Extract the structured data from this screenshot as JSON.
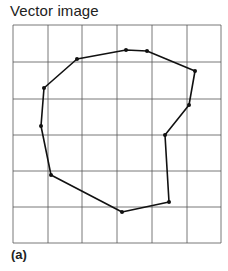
{
  "title": "Vector image",
  "caption": "(a)",
  "grid": {
    "x_lines": [
      13,
      48,
      82,
      117,
      152,
      187,
      221
    ],
    "y_lines": [
      25,
      62,
      99,
      135,
      171,
      207,
      243
    ],
    "color": "#555555"
  },
  "polygon": {
    "color": "#111111",
    "vertices": [
      [
        77,
        59
      ],
      [
        126,
        50
      ],
      [
        147,
        51
      ],
      [
        195,
        71
      ],
      [
        189,
        105
      ],
      [
        165,
        135
      ],
      [
        169,
        202
      ],
      [
        122,
        212
      ],
      [
        51,
        175
      ],
      [
        41,
        126
      ],
      [
        44,
        88
      ]
    ]
  }
}
